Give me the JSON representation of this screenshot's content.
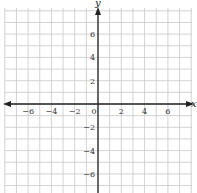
{
  "chart_data": {
    "type": "scatter",
    "title": "",
    "xlabel": "x",
    "ylabel": "y",
    "xlim": [
      -8,
      8
    ],
    "ylim": [
      -8,
      8
    ],
    "grid": true,
    "grid_step": 1,
    "x_ticks": [
      -6,
      -4,
      -2,
      0,
      2,
      4,
      6
    ],
    "y_ticks": [
      6,
      4,
      2,
      -2,
      -4,
      -6
    ],
    "x_tick_labels": [
      "−6",
      "−4",
      "−2",
      "0",
      "2",
      "4",
      "6"
    ],
    "y_tick_labels": [
      "6",
      "4",
      "2",
      "−2",
      "−4",
      "−6"
    ],
    "series": [],
    "legend": null
  },
  "layout": {
    "origin_px": [
      98,
      104
    ],
    "unit_px": 11.65,
    "grid_color": "#c8c8c8",
    "axis_color": "#222222"
  }
}
